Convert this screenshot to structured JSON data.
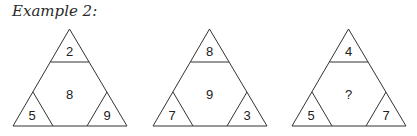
{
  "caption": "Example 2:",
  "puzzles": [
    {
      "top": "2",
      "center": "8",
      "bottom_left": "5",
      "bottom_right": "9"
    },
    {
      "top": "8",
      "center": "9",
      "bottom_left": "7",
      "bottom_right": "3"
    },
    {
      "top": "4",
      "center": "?",
      "bottom_left": "5",
      "bottom_right": "7"
    }
  ],
  "colors": {
    "line": "#333333",
    "text": "#222222",
    "background": "#ffffff"
  }
}
